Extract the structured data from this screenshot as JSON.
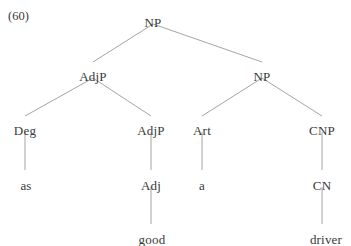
{
  "figure": {
    "example_number": "(60)",
    "kind": "syntax-tree",
    "line_color": "#9a9a9a",
    "text_color": "#3a3a3a",
    "background_color": "#ffffff"
  },
  "tree": {
    "nodes": [
      {
        "id": "np-root",
        "label": "NP",
        "x": 153,
        "y": 16,
        "level": 0
      },
      {
        "id": "adjp-1",
        "label": "AdjP",
        "x": 93,
        "y": 70,
        "level": 1
      },
      {
        "id": "np-2",
        "label": "NP",
        "x": 262,
        "y": 70,
        "level": 1
      },
      {
        "id": "deg",
        "label": "Deg",
        "x": 25,
        "y": 124,
        "level": 2
      },
      {
        "id": "adjp-2",
        "label": "AdjP",
        "x": 151,
        "y": 124,
        "level": 2
      },
      {
        "id": "art",
        "label": "Art",
        "x": 202,
        "y": 124,
        "level": 2
      },
      {
        "id": "cnp",
        "label": "CNP",
        "x": 322,
        "y": 124,
        "level": 2
      },
      {
        "id": "adj",
        "label": "Adj",
        "x": 151,
        "y": 179,
        "level": 3
      },
      {
        "id": "cn",
        "label": "CN",
        "x": 322,
        "y": 179,
        "level": 3
      }
    ],
    "leaves": [
      {
        "id": "leaf-as",
        "label": "as",
        "x": 26,
        "y": 179
      },
      {
        "id": "leaf-a",
        "label": "a",
        "x": 202,
        "y": 179
      },
      {
        "id": "leaf-good",
        "label": "good",
        "x": 152,
        "y": 233
      },
      {
        "id": "leaf-driver",
        "label": "driver",
        "x": 326,
        "y": 233
      }
    ],
    "edges": [
      {
        "id": "edge-np-adjp1",
        "from": "np-root",
        "to": "adjp-1",
        "x1": 153,
        "y1": 24,
        "x2": 93,
        "y2": 62
      },
      {
        "id": "edge-np-np2",
        "from": "np-root",
        "to": "np-2",
        "x1": 153,
        "y1": 24,
        "x2": 262,
        "y2": 62
      },
      {
        "id": "edge-adjp1-deg",
        "from": "adjp-1",
        "to": "deg",
        "x1": 93,
        "y1": 78,
        "x2": 25,
        "y2": 116
      },
      {
        "id": "edge-adjp1-adjp2",
        "from": "adjp-1",
        "to": "adjp-2",
        "x1": 93,
        "y1": 78,
        "x2": 151,
        "y2": 116
      },
      {
        "id": "edge-np2-art",
        "from": "np-2",
        "to": "art",
        "x1": 262,
        "y1": 78,
        "x2": 202,
        "y2": 116
      },
      {
        "id": "edge-np2-cnp",
        "from": "np-2",
        "to": "cnp",
        "x1": 262,
        "y1": 78,
        "x2": 322,
        "y2": 116
      },
      {
        "id": "edge-deg-as",
        "from": "deg",
        "to": "leaf-as",
        "x1": 25,
        "y1": 132,
        "x2": 25,
        "y2": 170
      },
      {
        "id": "edge-adjp2-adj",
        "from": "adjp-2",
        "to": "adj",
        "x1": 151,
        "y1": 132,
        "x2": 151,
        "y2": 170
      },
      {
        "id": "edge-art-a",
        "from": "art",
        "to": "leaf-a",
        "x1": 202,
        "y1": 132,
        "x2": 202,
        "y2": 170
      },
      {
        "id": "edge-cnp-cn",
        "from": "cnp",
        "to": "cn",
        "x1": 322,
        "y1": 132,
        "x2": 322,
        "y2": 170
      },
      {
        "id": "edge-adj-good",
        "from": "adj",
        "to": "leaf-good",
        "x1": 151,
        "y1": 187,
        "x2": 151,
        "y2": 224
      },
      {
        "id": "edge-cn-driver",
        "from": "cn",
        "to": "leaf-driver",
        "x1": 322,
        "y1": 187,
        "x2": 322,
        "y2": 224
      }
    ]
  }
}
